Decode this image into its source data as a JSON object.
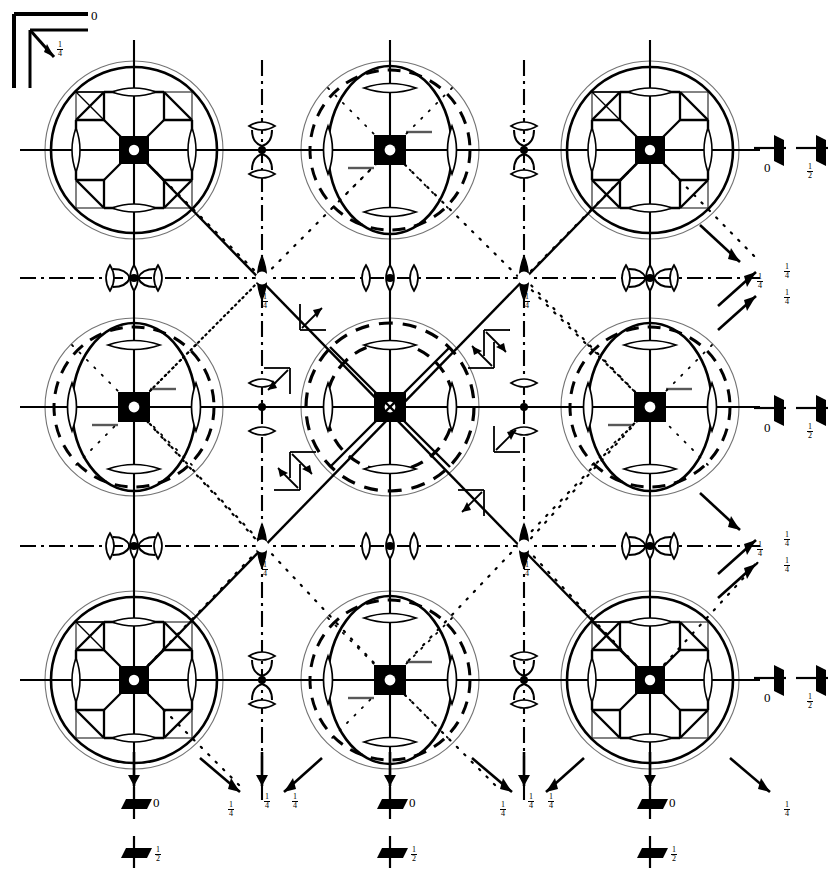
{
  "figure": {
    "type": "crystallographic-space-group-symmetry-diagram",
    "background": "#ffffff",
    "ink": "#000000",
    "width": 839,
    "height": 882
  },
  "axis_indicator": {
    "name": "origin-axis-indicator",
    "origin_label": "0",
    "diagonal_label_numerator": "1",
    "diagonal_label_denominator": "4"
  },
  "heights": {
    "zero": "0",
    "quarter_n": "1",
    "quarter_d": "4",
    "half_n": "1",
    "half_d": "2"
  },
  "right_edge_markers": [
    {
      "name": "twofold-in-plane-pair-row-1",
      "y": 150,
      "labels": [
        "0",
        "1/2"
      ]
    },
    {
      "name": "twofold-in-plane-pair-row-2",
      "y": 407,
      "labels": [
        "0",
        "1/2"
      ]
    },
    {
      "name": "twofold-in-plane-pair-row-3",
      "y": 680,
      "labels": [
        "0",
        "1/2"
      ]
    }
  ],
  "bottom_edge_markers": [
    {
      "name": "twofold-in-plane-pair-col-1",
      "x": 134,
      "labels": [
        "0",
        "1/2"
      ]
    },
    {
      "name": "twofold-in-plane-pair-col-2",
      "x": 390,
      "labels": [
        "0",
        "1/2"
      ]
    },
    {
      "name": "twofold-in-plane-pair-col-3",
      "x": 650,
      "labels": [
        "0",
        "1/2"
      ]
    }
  ],
  "quarter_labels_right": [
    {
      "id": "r1",
      "x": 757,
      "y": 272
    },
    {
      "id": "r2",
      "x": 784,
      "y": 262
    },
    {
      "id": "r3",
      "x": 784,
      "y": 288
    },
    {
      "id": "r4",
      "x": 757,
      "y": 540
    },
    {
      "id": "r5",
      "x": 784,
      "y": 530
    },
    {
      "id": "r6",
      "x": 784,
      "y": 556
    }
  ],
  "quarter_labels_bottom": [
    {
      "id": "b1",
      "x": 228,
      "y": 800
    },
    {
      "id": "b2",
      "x": 264,
      "y": 792
    },
    {
      "id": "b3",
      "x": 292,
      "y": 792
    },
    {
      "id": "b4",
      "x": 500,
      "y": 800
    },
    {
      "id": "b5",
      "x": 528,
      "y": 792
    },
    {
      "id": "b6",
      "x": 548,
      "y": 792
    },
    {
      "id": "b7",
      "x": 784,
      "y": 800
    }
  ],
  "quarter_labels_interior": [
    {
      "id": "i1",
      "x": 262,
      "y": 292
    },
    {
      "id": "i2",
      "x": 524,
      "y": 292
    },
    {
      "id": "i3",
      "x": 262,
      "y": 560
    },
    {
      "id": "i4",
      "x": 524,
      "y": 560
    }
  ],
  "lattice": {
    "columns_x": [
      134,
      390,
      650
    ],
    "rows_y": [
      150,
      407,
      680
    ],
    "mid_x": [
      262,
      524
    ],
    "mid_y": [
      278,
      546
    ]
  },
  "symbols": {
    "fourfold_square": "filled-square-with-white-circle",
    "twofold_lens": "lens-shape",
    "twofold_inversion": "filled-lens-with-white-center",
    "screw_half_arrow": "half-arrow",
    "glide_arrow": "glide-plane-arrow",
    "mirror_solid_line": "solid-line",
    "glide_dash_dot_line": "dash-dot-line",
    "diagonal_dotted_line": "dotted-line",
    "diagonal_solid_line": "solid-diagonal",
    "motif_circle_solid": "solid-circle",
    "motif_circle_dashed": "dashed-circle"
  }
}
